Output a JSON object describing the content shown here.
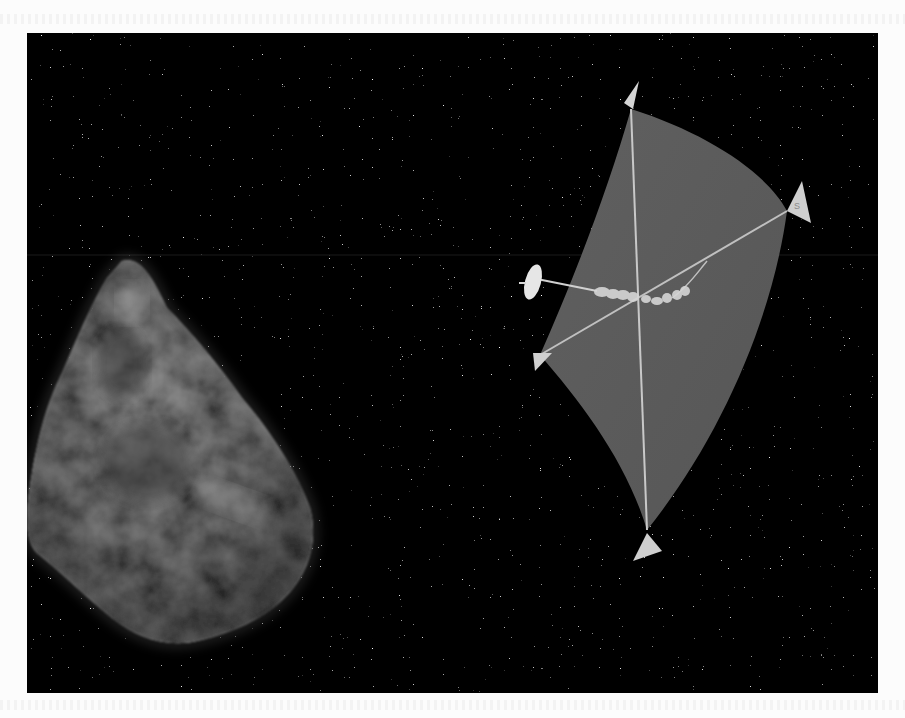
{
  "figure": {
    "background_color": "#050505",
    "page_color": "#fcfcfc",
    "sail": {
      "fill_color": "#5a5a5a",
      "strut_color": "#c8c8c8",
      "corner_vane_color": "#cfcfcf",
      "corner_vane_mark": "S"
    },
    "asteroid": {
      "base_color": "#6e6e6e",
      "highlight_color": "#9a9a9a"
    },
    "antenna_dish": {
      "color": "#e6e6e6"
    }
  }
}
